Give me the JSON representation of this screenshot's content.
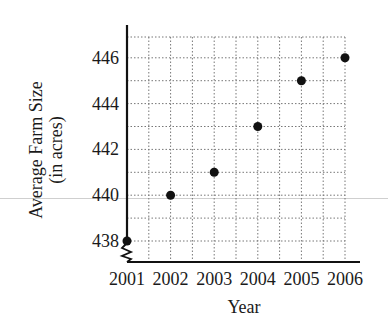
{
  "chart_data": {
    "type": "scatter",
    "title": "",
    "xlabel": "Year",
    "ylabel": "Average Farm Size",
    "ylabel_line2": "(in acres)",
    "x": [
      2001,
      2002,
      2003,
      2004,
      2005,
      2006
    ],
    "y": [
      438,
      440,
      441,
      443,
      445,
      446
    ],
    "x_tick_labels": [
      "2001",
      "2002",
      "2003",
      "2004",
      "2005",
      "2006"
    ],
    "y_tick_labels": [
      "438",
      "440",
      "442",
      "444",
      "446"
    ],
    "y_ticks": [
      438,
      440,
      442,
      444,
      446
    ],
    "ylim": [
      437,
      447
    ],
    "xlim": [
      2001,
      2006.3
    ],
    "grid": true,
    "grid_style": "dotted",
    "axis_break": "y-axis break (zigzag) below 438",
    "legend": null,
    "point_color": "#111111"
  }
}
